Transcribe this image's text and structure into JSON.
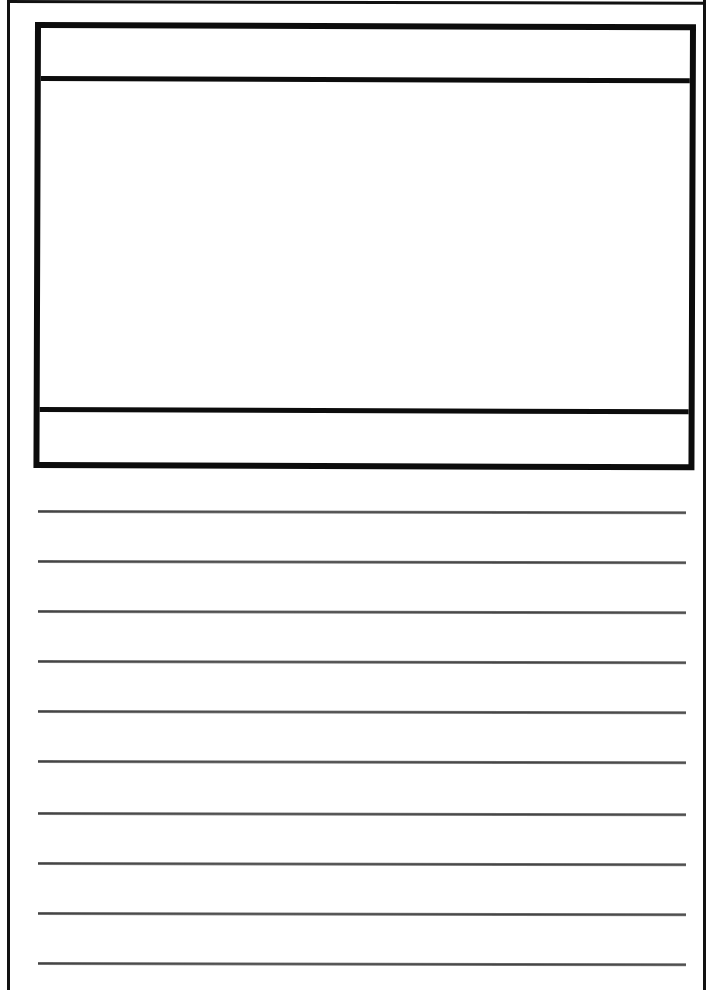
{
  "page": {
    "type": "lined-writing-template",
    "background": "#ffffff",
    "frame_color": "#0c0c0c",
    "line_color": "#555555"
  },
  "frame": {
    "header_text": "",
    "body_text": "",
    "footer_text": ""
  },
  "ruled_lines": {
    "count": 10,
    "tops": [
      510,
      560,
      610,
      660,
      710,
      760,
      812,
      862,
      912,
      962
    ],
    "texts": [
      "",
      "",
      "",
      "",
      "",
      "",
      "",
      "",
      "",
      ""
    ]
  }
}
